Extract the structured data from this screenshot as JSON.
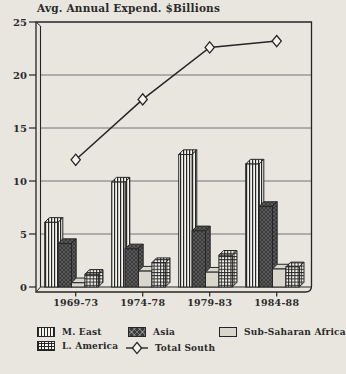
{
  "chart_data": {
    "type": "bar",
    "subtype": "grouped-3d-bars-with-line-overlay",
    "title": "Avg. Annual Expend. $Billions",
    "categories": [
      "1969-73",
      "1974-78",
      "1979-83",
      "1984-88"
    ],
    "series": [
      {
        "name": "M. East",
        "type": "bar",
        "pattern": "vstripes",
        "values": [
          6.1,
          9.9,
          12.5,
          11.6
        ]
      },
      {
        "name": "Asia",
        "type": "bar",
        "pattern": "crosshatch",
        "values": [
          4.1,
          3.6,
          5.3,
          7.6
        ]
      },
      {
        "name": "Sub-Saharan Africa",
        "type": "bar",
        "pattern": "solid-light",
        "values": [
          0.4,
          1.5,
          1.4,
          1.7
        ]
      },
      {
        "name": "L. America",
        "type": "bar",
        "pattern": "grid",
        "values": [
          1.2,
          2.3,
          3.0,
          1.9
        ]
      },
      {
        "name": "Total South",
        "type": "line",
        "marker": "diamond",
        "values": [
          12.0,
          17.7,
          22.6,
          23.2
        ]
      }
    ],
    "xlabel": "",
    "ylabel": "",
    "ylim": [
      0,
      25
    ],
    "yticks": [
      0,
      5,
      10,
      15,
      20,
      25
    ],
    "grid": true,
    "legend_position": "bottom",
    "legend_rows": [
      [
        0,
        1,
        2
      ],
      [
        3,
        4
      ]
    ],
    "colors": {
      "paper": "#e9e6df",
      "ink": "#262626",
      "light_fill": "#d9d6ce",
      "pattern_bg": "#f6f4ee",
      "dark_fill": "#3b3b3b"
    }
  }
}
